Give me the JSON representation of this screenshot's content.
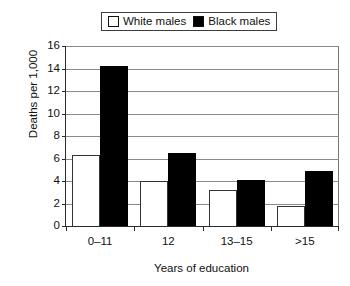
{
  "chart_data": {
    "type": "bar",
    "title": "",
    "xlabel": "Years of education",
    "ylabel": "Deaths per 1,000",
    "categories": [
      "0–11",
      "12",
      "13–15",
      ">15"
    ],
    "series": [
      {
        "name": "White males",
        "color": "#ffffff",
        "values": [
          6.3,
          4.0,
          3.2,
          1.8
        ]
      },
      {
        "name": "Black males",
        "color": "#000000",
        "values": [
          14.2,
          6.5,
          4.1,
          4.9
        ]
      }
    ],
    "ylim": [
      0,
      16
    ],
    "ytick_labels": [
      "16",
      "14",
      "12",
      "10",
      "8",
      "6",
      "4",
      "2",
      "0"
    ],
    "ytick_values": [
      16,
      14,
      12,
      10,
      8,
      6,
      4,
      2,
      0
    ],
    "grid": true,
    "grid_axis": "y",
    "legend_position": "top-center",
    "legend_entries": [
      "White males",
      "Black males"
    ]
  },
  "legend": {
    "entries": [
      {
        "label": "White males",
        "swatch": "white-square-swatch"
      },
      {
        "label": "Black males",
        "swatch": "black-square-swatch"
      }
    ]
  },
  "axes": {
    "y_title": "Deaths per 1,000",
    "x_title": "Years of education"
  }
}
